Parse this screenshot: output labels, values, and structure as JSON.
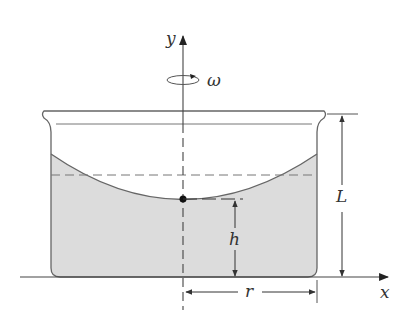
{
  "figure": {
    "colors": {
      "line": "#555555",
      "liquid_fill": "#dcdcdc",
      "background": "#ffffff",
      "vertex_dot": "#111111"
    }
  },
  "labels": {
    "y_axis": "y",
    "x_axis": "x",
    "omega": "ω",
    "height_L": "L",
    "height_h": "h",
    "radius_r": "r"
  }
}
